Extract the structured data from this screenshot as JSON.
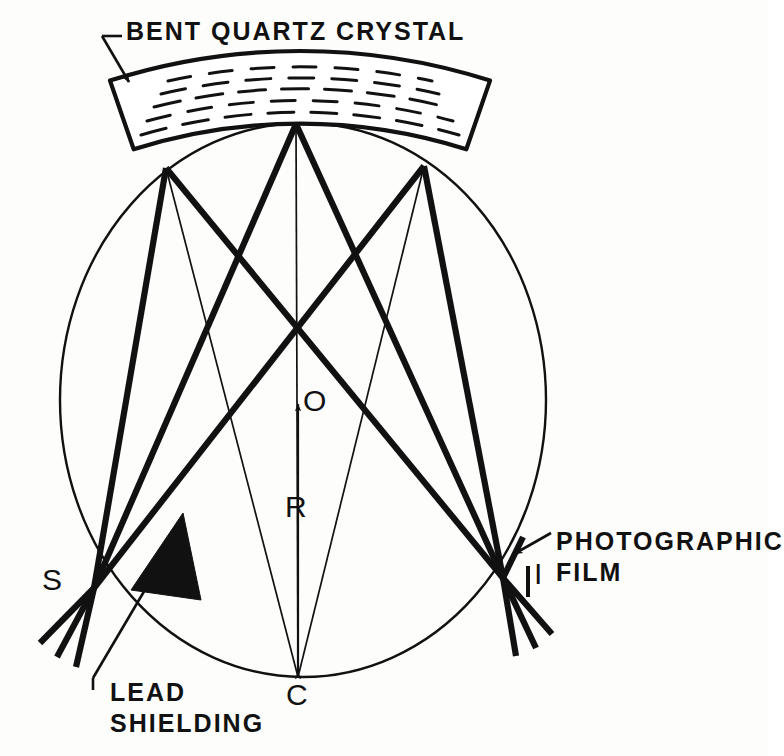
{
  "figure": {
    "kind": "optical-ray-diagram",
    "background_color": "#fdfdfc",
    "ink_color": "#111111"
  },
  "annotations": {
    "crystal_label": "BENT QUARTZ CRYSTAL",
    "film_label_line1": "PHOTOGRAPHIC",
    "film_label_line2": "FILM",
    "shield_label_line1": "LEAD",
    "shield_label_line2": "SHIELDING"
  },
  "points": [
    {
      "id": "S",
      "label": "S",
      "meaning": "source",
      "x": 94,
      "y": 588
    },
    {
      "id": "I",
      "label": "I",
      "meaning": "image-on-film",
      "x": 503,
      "y": 578
    },
    {
      "id": "O",
      "label": "O",
      "meaning": "circle-center",
      "x": 298,
      "y": 400
    },
    {
      "id": "C",
      "label": "C",
      "meaning": "crystal-curvature-center",
      "x": 298,
      "y": 677
    },
    {
      "id": "R",
      "label": "R",
      "meaning": "radius-dimension",
      "x": 298,
      "y": 520
    }
  ],
  "geometry": {
    "focal_circle": {
      "cx": 303,
      "cy": 400,
      "rx": 243,
      "ry": 277
    },
    "reflection_points": [
      {
        "x": 166,
        "y": 168
      },
      {
        "x": 296,
        "y": 124
      },
      {
        "x": 424,
        "y": 166
      }
    ],
    "crystal": {
      "inner_radius": 553,
      "outer_radius": 625,
      "center_x": 300,
      "center_y": 677,
      "half_angle_deg": 17.5,
      "lattice_rows": 5
    },
    "lead_shield_triangle": [
      {
        "x": 133,
        "y": 588
      },
      {
        "x": 182,
        "y": 515
      },
      {
        "x": 200,
        "y": 600
      }
    ],
    "radius_arrow": {
      "from_x": 298,
      "from_y": 677,
      "to_x": 298,
      "to_y": 398
    }
  },
  "leaders": {
    "crystal": {
      "text_x": 125,
      "text_y": 32,
      "tail_x": 100,
      "tail_y": 35,
      "tip_x": 130,
      "tip_y": 85
    },
    "film": {
      "text_x": 556,
      "text_y": 537,
      "tip_x": 516,
      "tip_y": 553
    },
    "shield": {
      "text_x": 108,
      "text_y": 690,
      "tail_x": 92,
      "tail_y": 683,
      "tip_x": 160,
      "tip_y": 565
    }
  }
}
